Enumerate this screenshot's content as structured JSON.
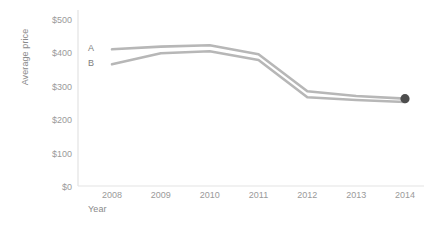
{
  "chart_data": {
    "type": "line",
    "title": "",
    "xlabel": "Year",
    "ylabel": "Average price",
    "x": [
      2008,
      2009,
      2010,
      2011,
      2012,
      2013,
      2014
    ],
    "categories": [
      "2008",
      "2009",
      "2010",
      "2011",
      "2012",
      "2013",
      "2014"
    ],
    "series": [
      {
        "name": "A",
        "values": [
          410,
          418,
          422,
          395,
          284,
          270,
          262
        ],
        "color": "#b7b7b7"
      },
      {
        "name": "B",
        "values": [
          365,
          398,
          404,
          378,
          266,
          258,
          252
        ],
        "color": "#b7b7b7"
      }
    ],
    "ylim": [
      0,
      500
    ],
    "ytick_labels": [
      "$0",
      "$100",
      "$200",
      "$300",
      "$400",
      "$500"
    ],
    "ytick_values": [
      0,
      100,
      200,
      300,
      400,
      500
    ],
    "xtick_labels": [
      "2008",
      "2009",
      "2010",
      "2011",
      "2012",
      "2013",
      "2014"
    ],
    "grid": false,
    "legend_position": "inline-left",
    "marker": {
      "name": "end-point-marker",
      "x": 2014,
      "y": 262,
      "color": "#4d4d4d"
    },
    "axis_color": "#e3e3e3",
    "tick_text_color": "#9a9a9a",
    "axis_title_color": "#8a8a8a"
  }
}
